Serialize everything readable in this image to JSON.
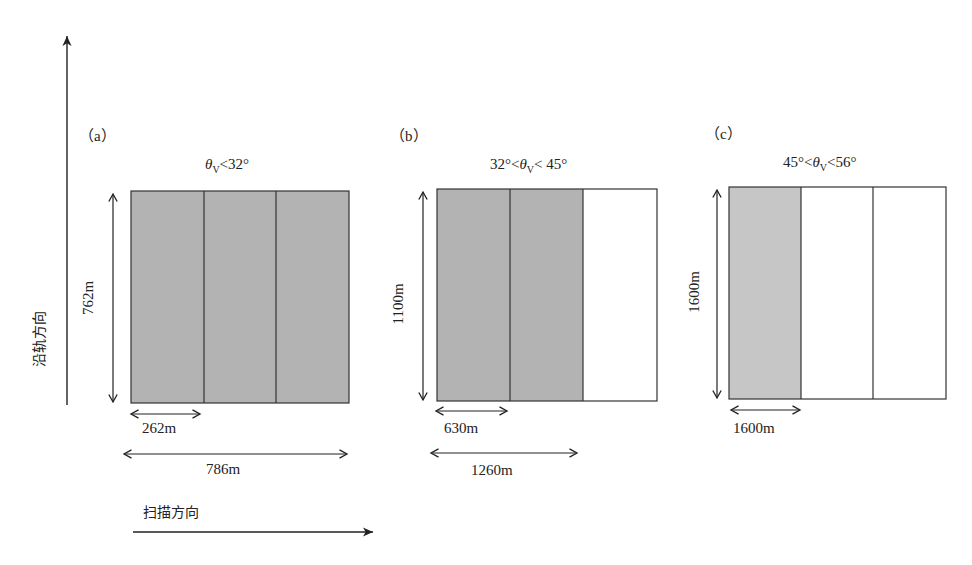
{
  "axes": {
    "along_track_label": "沿轨方向",
    "scan_direction_label": "扫描方向"
  },
  "panels": [
    {
      "id": "a",
      "label": "（a）",
      "condition_prefix": "",
      "theta_symbol": "θ",
      "theta_sub": "V",
      "condition_suffix": "<32°",
      "height_label": "762m",
      "cell_width_label": "262m",
      "total_width_label": "786m",
      "cells": [
        {
          "filled": true
        },
        {
          "filled": true
        },
        {
          "filled": true
        }
      ]
    },
    {
      "id": "b",
      "label": "（b）",
      "condition_prefix": "32°<",
      "theta_symbol": "θ",
      "theta_sub": "V",
      "condition_suffix": "< 45°",
      "height_label": "1100m",
      "cell_width_label": "630m",
      "total_width_label": "1260m",
      "cells": [
        {
          "filled": true
        },
        {
          "filled": true
        },
        {
          "filled": false
        }
      ]
    },
    {
      "id": "c",
      "label": "（c）",
      "condition_prefix": "45°<",
      "theta_symbol": "θ",
      "theta_sub": "V",
      "condition_suffix": "<56°",
      "height_label": "1600m",
      "cell_width_label": "1600m",
      "cells": [
        {
          "filled": true
        },
        {
          "filled": false
        },
        {
          "filled": false
        }
      ]
    }
  ],
  "colors": {
    "fill_dark": "#b3b3b3",
    "fill_light": "#c6c6c6",
    "line": "#333333"
  }
}
